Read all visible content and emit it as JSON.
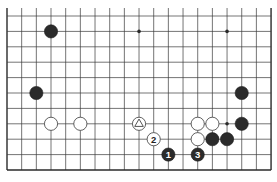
{
  "board": {
    "cols": 19,
    "rows": 11,
    "origin_x": 7,
    "origin_y": 16,
    "spacing_x": 14.67,
    "spacing_y": 15.4,
    "top_edge_open": true,
    "line_color": "#3a3a3a",
    "edge_color": "#2a2a2a",
    "black_color": "#2b2b2b",
    "white_color": "#ffffff",
    "star_points": [
      [
        9,
        1
      ],
      [
        15,
        1
      ],
      [
        15,
        7
      ]
    ],
    "stones": [
      {
        "color": "black",
        "col": 3,
        "row": 1,
        "label": ""
      },
      {
        "color": "black",
        "col": 2,
        "row": 5,
        "label": ""
      },
      {
        "color": "black",
        "col": 16,
        "row": 5,
        "label": ""
      },
      {
        "color": "white",
        "col": 3,
        "row": 7,
        "label": ""
      },
      {
        "color": "white",
        "col": 5,
        "row": 7,
        "label": ""
      },
      {
        "color": "white",
        "col": 9,
        "row": 7,
        "label": "",
        "marker": "triangle"
      },
      {
        "color": "white",
        "col": 13,
        "row": 7,
        "label": ""
      },
      {
        "color": "white",
        "col": 14,
        "row": 7,
        "label": ""
      },
      {
        "color": "black",
        "col": 16,
        "row": 7,
        "label": ""
      },
      {
        "color": "white",
        "col": 10,
        "row": 8,
        "label": "2"
      },
      {
        "color": "white",
        "col": 13,
        "row": 8,
        "label": ""
      },
      {
        "color": "black",
        "col": 14,
        "row": 8,
        "label": ""
      },
      {
        "color": "black",
        "col": 15,
        "row": 8,
        "label": ""
      },
      {
        "color": "black",
        "col": 11,
        "row": 9,
        "label": "1"
      },
      {
        "color": "black",
        "col": 13,
        "row": 9,
        "label": "3"
      }
    ]
  },
  "caption": ""
}
